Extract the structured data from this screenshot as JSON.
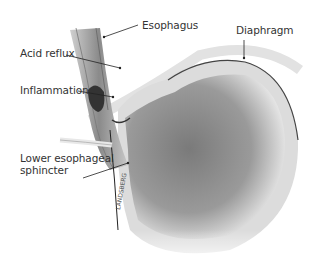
{
  "figure": {
    "labels": {
      "esophagus": "Esophagus",
      "diaphragm": "Diaphragm",
      "acid_reflux": "Acid reflux",
      "inflammation": "Inflammation",
      "les_line1": "Lower esophageal",
      "les_line2": "sphincter"
    },
    "signature": "LANDSBERG"
  }
}
